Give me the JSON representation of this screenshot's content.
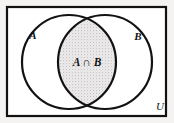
{
  "diagram": {
    "type": "venn",
    "universe": {
      "label": "U",
      "label_x": 160,
      "label_y": 110,
      "rect": {
        "x": 7,
        "y": 7,
        "width": 159,
        "height": 109
      },
      "border_color": "#121212",
      "border_width": 2.2,
      "fill_color": "#ffffff"
    },
    "background_color": "#f4f3f1",
    "circles": [
      {
        "name": "set-a",
        "label": "A",
        "cx": 69,
        "cy": 62,
        "r": 47,
        "label_x": 33,
        "label_y": 39,
        "stroke_color": "#121212",
        "stroke_width": 2.2,
        "fill_color": "none"
      },
      {
        "name": "set-b",
        "label": "B",
        "cx": 105,
        "cy": 62,
        "r": 47,
        "label_x": 138,
        "label_y": 40,
        "stroke_color": "#121212",
        "stroke_width": 2.2,
        "fill_color": "none"
      }
    ],
    "intersection": {
      "label": "A ∩ B",
      "label_x": 87,
      "label_y": 66,
      "shade_color": "#e4e3e2",
      "shaded": true
    }
  }
}
